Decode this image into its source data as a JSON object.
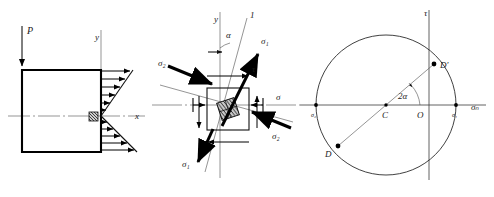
{
  "figure": {
    "panels": [
      {
        "id": "beam-panel",
        "name": "cantilever-beam-with-bending-stress-distribution",
        "labels": {
          "load": "P",
          "axis_y": "y",
          "axis_x": "x"
        }
      },
      {
        "id": "element-panel",
        "name": "stress-element-with-principal-directions",
        "labels": {
          "axis_y": "y",
          "principal_dir": "1",
          "angle": "α",
          "sigma1_top": "σ₁",
          "sigma1_bottom": "σ₁",
          "sigma2_left": "σ₂",
          "sigma2_right": "σ₂",
          "sigma": "σ",
          "tau": "τ"
        }
      },
      {
        "id": "mohr-panel",
        "name": "mohr-circle",
        "labels": {
          "axis_tau": "τ",
          "axis_sigma_n": "σₙ",
          "sigma2": "σ₂",
          "sigma1": "σ₁",
          "center": "C",
          "origin": "O",
          "point_d": "D",
          "point_d_prime": "D′",
          "angle_2alpha": "2α"
        }
      }
    ]
  },
  "colors": {
    "ink": "#111111",
    "thin_ink": "#4d4d4d",
    "background": "#ffffff"
  }
}
